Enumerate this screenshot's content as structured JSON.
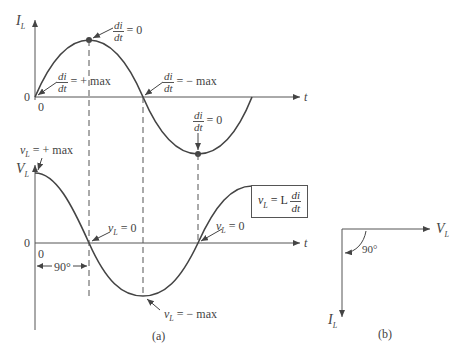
{
  "figure": {
    "part_a_label": "(a)",
    "part_b_label": "(b)",
    "top_plot": {
      "y_axis_label": "I",
      "y_axis_sub": "L",
      "x_axis_label": "t",
      "origin_y": "0",
      "origin_x": "0",
      "annotations": {
        "peak": {
          "num": "di",
          "den": "dt",
          "rhs": "= 0"
        },
        "start": {
          "num": "di",
          "den": "dt",
          "rhs": "= + max"
        },
        "zero_cross": {
          "num": "di",
          "den": "dt",
          "rhs": "= − max"
        },
        "trough": {
          "num": "di",
          "den": "dt",
          "rhs": "= 0"
        }
      }
    },
    "bottom_plot": {
      "y_axis_label": "V",
      "y_axis_sub": "L",
      "x_axis_label": "t",
      "origin_y": "0",
      "origin_x": "0",
      "phase_label": "90°",
      "annotations": {
        "start": {
          "var": "v",
          "sub": "L",
          "rhs": "= + max"
        },
        "zero1": {
          "var": "v",
          "sub": "L",
          "rhs": "= 0"
        },
        "zero2": {
          "var": "v",
          "sub": "L",
          "rhs": "= 0"
        },
        "min": {
          "var": "v",
          "sub": "L",
          "rhs": "= − max"
        }
      },
      "formula": {
        "lhs_var": "v",
        "lhs_sub": "L",
        "eq": "= L",
        "num": "di",
        "den": "dt"
      }
    },
    "phasor": {
      "horizontal_label": "V",
      "horizontal_sub": "L",
      "vertical_label": "I",
      "vertical_sub": "L",
      "angle_label": "90°"
    },
    "colors": {
      "curve": "#444444",
      "axis": "#555555",
      "text": "#444444"
    }
  }
}
